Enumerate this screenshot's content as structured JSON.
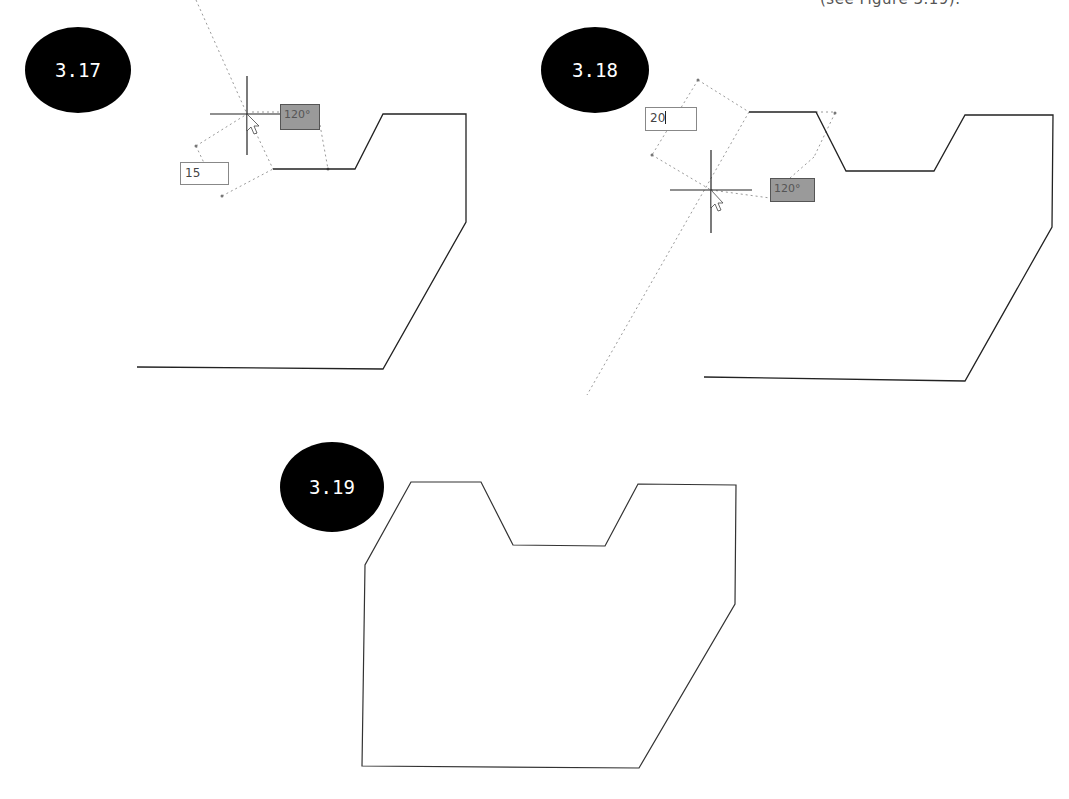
{
  "caption_fragment": "(see Figure 3.19).",
  "figures": [
    {
      "id": "3.17",
      "badge_label": "3.17",
      "length_input": "15",
      "angle_tooltip": "120°",
      "polyline": "273,169 355,169 383,114 466,114 466,222 383,369 137,367"
    },
    {
      "id": "3.18",
      "badge_label": "3.18",
      "length_input": "20",
      "angle_tooltip": "120°",
      "polyline": "749,112 816,112 846,171 934,171 965,115 1053,115 1052,227 965,381 704,377"
    },
    {
      "id": "3.19",
      "badge_label": "3.19",
      "polygon": "411,482 481,482 513,545 605,546 638,484 736,485 735,604 639,768 362,766 365,565"
    }
  ],
  "colors": {
    "badge_fill": "#000000",
    "badge_text": "#ffffff",
    "line": "#222222",
    "tracking_dots": "#9a9a9a",
    "angle_box_fill": "#9a9a9a"
  }
}
